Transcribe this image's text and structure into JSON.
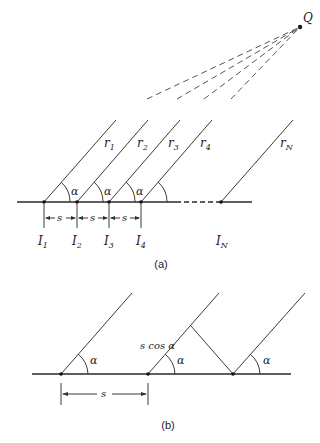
{
  "figure_a": {
    "caption": "(a)",
    "source_label": "Q",
    "rays": [
      {
        "label": "r",
        "sub": "1"
      },
      {
        "label": "r",
        "sub": "2"
      },
      {
        "label": "r",
        "sub": "3"
      },
      {
        "label": "r",
        "sub": "4"
      },
      {
        "label": "r",
        "sub": "N"
      }
    ],
    "points": [
      {
        "label": "I",
        "sub": "1"
      },
      {
        "label": "I",
        "sub": "2"
      },
      {
        "label": "I",
        "sub": "3"
      },
      {
        "label": "I",
        "sub": "4"
      },
      {
        "label": "I",
        "sub": "N"
      }
    ],
    "angle_label": "α",
    "spacing_label": "s"
  },
  "figure_b": {
    "caption": "(b)",
    "angle_label": "α",
    "spacing_label": "s",
    "projection_label": "s cos α"
  }
}
